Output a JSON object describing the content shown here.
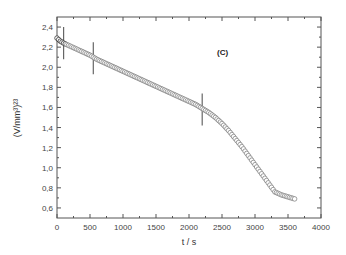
{
  "chart_data": {
    "type": "scatter",
    "title": "",
    "annotation": "(C)",
    "xlabel": "t / s",
    "ylabel": "(V/mm³)²³",
    "xlim": [
      0,
      4000
    ],
    "ylim": [
      0.5,
      2.5
    ],
    "xticks": [
      0,
      500,
      1000,
      1500,
      2000,
      2500,
      3000,
      3500,
      4000
    ],
    "xtick_labels": [
      "0",
      "500",
      "1000",
      "1500",
      "2000",
      "2500",
      "3000",
      "3500",
      "4000"
    ],
    "yticks": [
      0.6,
      0.8,
      1.0,
      1.2,
      1.4,
      1.6,
      1.8,
      2.0,
      2.2,
      2.4
    ],
    "ytick_labels": [
      "0,6",
      "0,8",
      "1,0",
      "1,2",
      "1,4",
      "1,6",
      "1,8",
      "2,0",
      "2,2",
      "2,4"
    ],
    "grid": false,
    "legend": null,
    "series": [
      {
        "name": "data",
        "marker": "open-circle",
        "x": [
          0,
          50,
          100,
          200,
          300,
          400,
          500,
          600,
          700,
          800,
          900,
          1000,
          1100,
          1200,
          1300,
          1400,
          1500,
          1600,
          1700,
          1800,
          1900,
          2000,
          2100,
          2200,
          2300,
          2400,
          2500,
          2600,
          2700,
          2800,
          2900,
          3000,
          3100,
          3200,
          3300,
          3400,
          3500,
          3600
        ],
        "y": [
          2.29,
          2.26,
          2.24,
          2.21,
          2.18,
          2.15,
          2.12,
          2.08,
          2.05,
          2.02,
          1.99,
          1.96,
          1.93,
          1.9,
          1.87,
          1.84,
          1.81,
          1.78,
          1.75,
          1.72,
          1.69,
          1.66,
          1.63,
          1.59,
          1.55,
          1.5,
          1.44,
          1.37,
          1.29,
          1.21,
          1.12,
          1.03,
          0.94,
          0.85,
          0.76,
          0.73,
          0.71,
          0.69
        ]
      }
    ],
    "error_markers": [
      {
        "x": 100,
        "y_low": 2.08,
        "y_high": 2.4
      },
      {
        "x": 550,
        "y_low": 1.93,
        "y_high": 2.25
      },
      {
        "x": 2200,
        "y_low": 1.42,
        "y_high": 1.74
      }
    ]
  }
}
